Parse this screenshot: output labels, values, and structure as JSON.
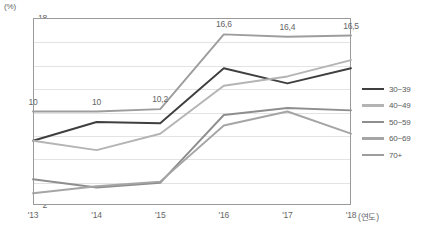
{
  "chart_data": {
    "type": "line",
    "title": "",
    "unit_label": "(%)",
    "xlabel": "(연도)",
    "ylabel": "(%)",
    "categories": [
      "'13",
      "'14",
      "'15",
      "'16",
      "'17",
      "'18"
    ],
    "ylim": [
      2,
      18
    ],
    "ytick_values": [
      2,
      4,
      6,
      8,
      10,
      12,
      14,
      16,
      18
    ],
    "ytick_labels": [
      "2",
      "4",
      "6",
      "8",
      "10",
      "12",
      "14",
      "16",
      "18"
    ],
    "grid": true,
    "legend_position": "right",
    "series": [
      {
        "name": "30~39",
        "color": "#3f3f3f",
        "values": [
          7.5,
          9.1,
          9.0,
          13.7,
          12.4,
          13.7
        ]
      },
      {
        "name": "40~49",
        "color": "#b4b4b4",
        "values": [
          7.5,
          6.7,
          8.1,
          12.2,
          13.0,
          14.4
        ]
      },
      {
        "name": "50~59",
        "color": "#8e8e8e",
        "values": [
          4.2,
          3.5,
          3.9,
          9.7,
          10.3,
          10.1
        ]
      },
      {
        "name": "60~69",
        "color": "#a5a5a5",
        "values": [
          3.0,
          3.6,
          4.0,
          8.8,
          10.0,
          8.1
        ]
      },
      {
        "name": "70+",
        "color": "#9d9d9d",
        "values": [
          10.0,
          10.0,
          10.2,
          16.6,
          16.4,
          16.5
        ]
      }
    ],
    "data_labels": [
      {
        "series": "70+",
        "category": "'13",
        "text": "10"
      },
      {
        "series": "70+",
        "category": "'14",
        "text": "10"
      },
      {
        "series": "70+",
        "category": "'15",
        "text": "10,2"
      },
      {
        "series": "70+",
        "category": "'16",
        "text": "16,6"
      },
      {
        "series": "70+",
        "category": "'17",
        "text": "16,4"
      },
      {
        "series": "70+",
        "category": "'18",
        "text": "16,5"
      }
    ]
  }
}
